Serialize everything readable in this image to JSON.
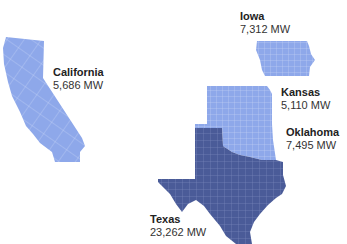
{
  "map": {
    "title": "",
    "units": "MW",
    "colors": {
      "low": "#8ea8ea",
      "high": "#4a5b98",
      "county_lines_low": "#c5d3f5",
      "county_lines_high": "#7f8cc0"
    },
    "states": [
      {
        "id": "california",
        "name": "California",
        "value": "5,686 MW",
        "mw": 5686,
        "tier": "low"
      },
      {
        "id": "iowa",
        "name": "Iowa",
        "value": "7,312 MW",
        "mw": 7312,
        "tier": "low"
      },
      {
        "id": "kansas",
        "name": "Kansas",
        "value": "5,110 MW",
        "mw": 5110,
        "tier": "low"
      },
      {
        "id": "oklahoma",
        "name": "Oklahoma",
        "value": "7,495 MW",
        "mw": 7495,
        "tier": "low"
      },
      {
        "id": "texas",
        "name": "Texas",
        "value": "23,262 MW",
        "mw": 23262,
        "tier": "high"
      }
    ]
  }
}
